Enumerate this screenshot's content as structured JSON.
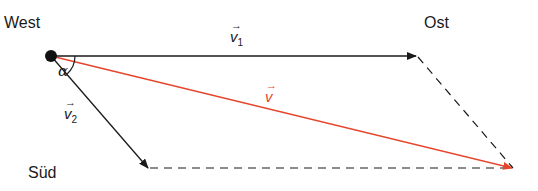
{
  "labels": {
    "west": "West",
    "east": "Ost",
    "south": "Süd"
  },
  "vectors": {
    "v1": {
      "symbol": "v",
      "subscript": "1",
      "arrow": "→"
    },
    "v2": {
      "symbol": "v",
      "subscript": "2",
      "arrow": "→"
    },
    "v": {
      "symbol": "v",
      "arrow": "→"
    }
  },
  "angle": {
    "symbol": "α"
  },
  "colors": {
    "line": "#1a1a1a",
    "resultant": "#e5452b"
  }
}
